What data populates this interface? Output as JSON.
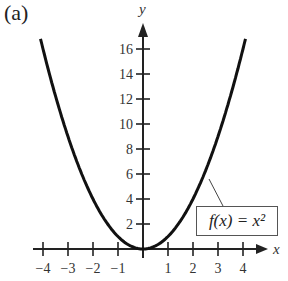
{
  "panel_label": "(a)",
  "chart_data": {
    "type": "line",
    "title": "",
    "xlabel": "x",
    "ylabel": "y",
    "function_label": "f(x) = x²",
    "x_ticks": [
      -4,
      -3,
      -2,
      -1,
      1,
      2,
      3,
      4
    ],
    "x_tick_labels": [
      "−4",
      "−3",
      "−2",
      "−1",
      "1",
      "2",
      "3",
      "4"
    ],
    "y_ticks": [
      2,
      4,
      6,
      8,
      10,
      12,
      14,
      16
    ],
    "y_tick_labels": [
      "2",
      "4",
      "6",
      "8",
      "10",
      "12",
      "14",
      "16"
    ],
    "xlim": [
      -4.5,
      4.5
    ],
    "ylim": [
      0,
      17.5
    ],
    "grid": false,
    "series": [
      {
        "name": "f(x) = x^2",
        "x": [
          -4.1,
          -4,
          -3,
          -2,
          -1,
          0,
          1,
          2,
          3,
          4,
          4.1
        ],
        "y": [
          16.81,
          16,
          9,
          4,
          1,
          0,
          1,
          4,
          9,
          16,
          16.81
        ]
      }
    ]
  }
}
